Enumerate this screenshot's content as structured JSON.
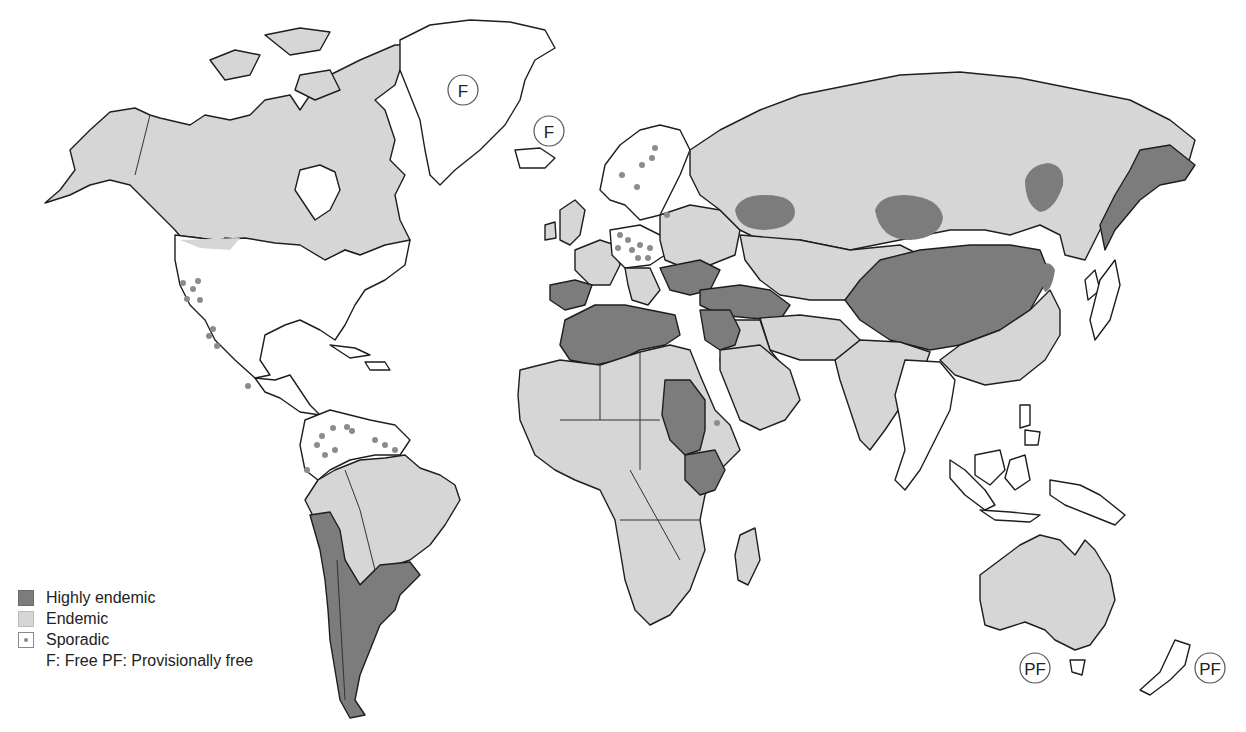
{
  "map": {
    "title": "",
    "colors": {
      "highly_endemic": "#7c7c7c",
      "endemic": "#d6d6d6",
      "sporadic": "#ffffff",
      "sporadic_dot": "#8c8c8c",
      "outline": "#1e1e1e"
    },
    "badges": [
      {
        "label": "F",
        "region": "Greenland",
        "x": 463,
        "y": 90
      },
      {
        "label": "F",
        "region": "Iceland",
        "x": 549,
        "y": 131
      },
      {
        "label": "PF",
        "region": "Australia",
        "x": 1035,
        "y": 668
      },
      {
        "label": "PF",
        "region": "New Zealand",
        "x": 1210,
        "y": 668
      }
    ],
    "regions": {
      "highly_endemic": [
        "Central Asia / Mongolia / Northern China",
        "Russian Far East (Kamchatka)",
        "North Africa (Morocco, Algeria, Libya, Tunisia)",
        "Sudan",
        "Kenya / Uganda",
        "Turkey / Middle East",
        "Southern South America (Argentina, Chile, Uruguay, S. Brazil, Peru coast)",
        "Iberia south",
        "Balkans"
      ],
      "endemic": [
        "Canada",
        "Alaska",
        "Russia",
        "Sub-Saharan Africa",
        "Arabian Peninsula",
        "India",
        "Southern China",
        "Brazil",
        "Bolivia",
        "Australia",
        "Western & Eastern Europe"
      ],
      "sporadic": [
        "United States",
        "Mexico",
        "Central America",
        "Colombia / Venezuela / Guianas",
        "Scandinavia",
        "Central Europe",
        "Southeast Asia",
        "Japan",
        "Korea",
        "Indonesia"
      ],
      "free": [
        "Greenland",
        "Iceland"
      ],
      "provisionally_free": [
        "Australia",
        "New Zealand"
      ]
    }
  },
  "legend": {
    "items": [
      {
        "key": "highly_endemic",
        "label": "Highly endemic"
      },
      {
        "key": "endemic",
        "label": "Endemic"
      },
      {
        "key": "sporadic",
        "label": "Sporadic"
      }
    ],
    "note": "F: Free PF: Provisionally free"
  }
}
